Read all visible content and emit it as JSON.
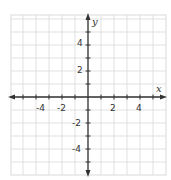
{
  "chart_data": {
    "type": "scatter",
    "title": "",
    "xlabel": "x",
    "ylabel": "y",
    "xlim": [
      -6,
      6
    ],
    "ylim": [
      -6,
      6
    ],
    "grid": true,
    "grid_step": 1,
    "x_tick_labels": [
      "-4",
      "-2",
      "2",
      "4"
    ],
    "y_tick_labels": [
      "4",
      "2",
      "-2",
      "-4"
    ],
    "series": [],
    "legend": null
  },
  "colors": {
    "grid": "#d9d9d9",
    "axis": "#333333",
    "background": "#ffffff"
  }
}
